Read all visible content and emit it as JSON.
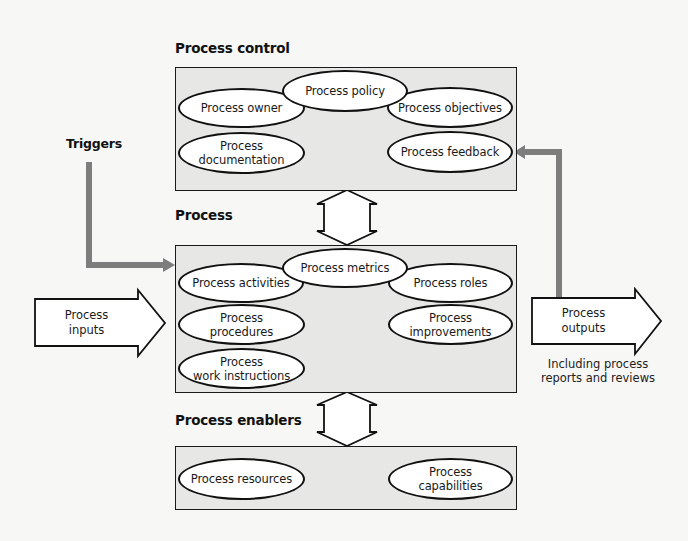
{
  "sections": {
    "control": {
      "label": "Process control",
      "nodes": [
        {
          "id": "policy",
          "label": "Process policy"
        },
        {
          "id": "owner",
          "label": "Process owner"
        },
        {
          "id": "objectives",
          "label": "Process objectives"
        },
        {
          "id": "documentation",
          "label": "Process\ndocumentation"
        },
        {
          "id": "feedback",
          "label": "Process feedback"
        }
      ]
    },
    "process": {
      "label": "Process",
      "nodes": [
        {
          "id": "metrics",
          "label": "Process metrics"
        },
        {
          "id": "activities",
          "label": "Process activities"
        },
        {
          "id": "roles",
          "label": "Process roles"
        },
        {
          "id": "procedures",
          "label": "Process\nprocedures"
        },
        {
          "id": "improvements",
          "label": "Process\nimprovements"
        },
        {
          "id": "work_instructions",
          "label": "Process\nwork instructions"
        }
      ]
    },
    "enablers": {
      "label": "Process enablers",
      "nodes": [
        {
          "id": "resources",
          "label": "Process resources"
        },
        {
          "id": "capabilities",
          "label": "Process\ncapabilities"
        }
      ]
    }
  },
  "flows": {
    "triggers": {
      "label": "Triggers"
    },
    "inputs": {
      "label": "Process\ninputs"
    },
    "outputs": {
      "label": "Process\noutputs",
      "note": "Including process\nreports and reviews"
    }
  },
  "colors": {
    "background": "#f7f7f6",
    "box_fill": "#e7e7e6",
    "outline": "#111111",
    "connector": "#7a7a7a"
  }
}
